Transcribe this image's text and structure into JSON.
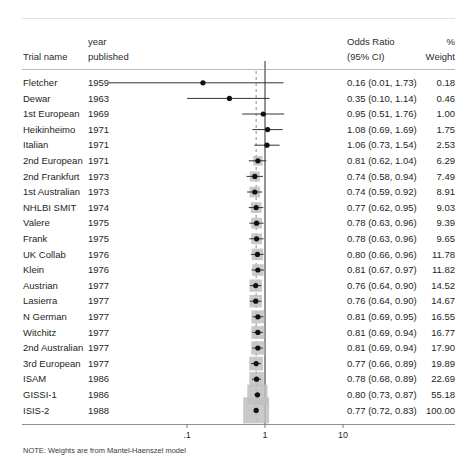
{
  "figure": {
    "type": "forest-plot",
    "note": "NOTE: Weights are from Mantel-Haenszel model"
  },
  "columns": {
    "trial_name": "Trial name",
    "year_line1": "year",
    "year_line2": "published",
    "odds_ratio_line1": "Odds Ratio",
    "odds_ratio_line2": "(95% CI)",
    "weight_line1": "%",
    "weight_line2": "Weight"
  },
  "axis": {
    "ticks": [
      {
        "label": ".1",
        "value": 0.1
      },
      {
        "label": "1",
        "value": 1
      },
      {
        "label": "10",
        "value": 10
      }
    ],
    "scale": "log",
    "null_value": 1,
    "summary_line_value": 0.77
  },
  "colors": {
    "box_fill": "#bfbfbf",
    "marker": "#111111",
    "ci_line": "#333333",
    "null_line": "#7a7a7a",
    "summary_line": "#8c8c8c",
    "rule": "#b9b9b9",
    "text": "#231f20"
  },
  "chart_data": {
    "type": "forest",
    "title": "",
    "xlabel": "",
    "ylabel": "",
    "xscale": "log",
    "xlim": [
      0.01,
      30
    ],
    "grid": false,
    "legend": "none",
    "effect_measure": "Odds Ratio",
    "ci_level": "95% CI",
    "columns": [
      "Trial name",
      "year published",
      "Odds Ratio (95% CI)",
      "% Weight"
    ],
    "rows": [
      {
        "name": "Fletcher",
        "year": "1959",
        "or": 0.16,
        "lo": 0.01,
        "hi": 1.73,
        "weight": 0.18,
        "ci_text": "0.16 (0.01, 1.73)",
        "weight_text": "0.18"
      },
      {
        "name": "Dewar",
        "year": "1963",
        "or": 0.35,
        "lo": 0.1,
        "hi": 1.14,
        "weight": 0.46,
        "ci_text": "0.35 (0.10, 1.14)",
        "weight_text": "0.46"
      },
      {
        "name": "1st European",
        "year": "1969",
        "or": 0.95,
        "lo": 0.51,
        "hi": 1.76,
        "weight": 1.0,
        "ci_text": "0.95 (0.51, 1.76)",
        "weight_text": "1.00"
      },
      {
        "name": "Heikinheimo",
        "year": "1971",
        "or": 1.08,
        "lo": 0.69,
        "hi": 1.69,
        "weight": 1.75,
        "ci_text": "1.08 (0.69, 1.69)",
        "weight_text": "1.75"
      },
      {
        "name": "Italian",
        "year": "1971",
        "or": 1.06,
        "lo": 0.73,
        "hi": 1.54,
        "weight": 2.53,
        "ci_text": "1.06 (0.73, 1.54)",
        "weight_text": "2.53"
      },
      {
        "name": "2nd European",
        "year": "1971",
        "or": 0.81,
        "lo": 0.62,
        "hi": 1.04,
        "weight": 6.29,
        "ci_text": "0.81 (0.62, 1.04)",
        "weight_text": "6.29"
      },
      {
        "name": "2nd Frankfurt",
        "year": "1973",
        "or": 0.74,
        "lo": 0.58,
        "hi": 0.94,
        "weight": 7.49,
        "ci_text": "0.74 (0.58, 0.94)",
        "weight_text": "7.49"
      },
      {
        "name": "1st Australian",
        "year": "1973",
        "or": 0.74,
        "lo": 0.59,
        "hi": 0.92,
        "weight": 8.91,
        "ci_text": "0.74 (0.59, 0.92)",
        "weight_text": "8.91"
      },
      {
        "name": "NHLBI SMIT",
        "year": "1974",
        "or": 0.77,
        "lo": 0.62,
        "hi": 0.95,
        "weight": 9.03,
        "ci_text": "0.77 (0.62, 0.95)",
        "weight_text": "9.03"
      },
      {
        "name": "Valere",
        "year": "1975",
        "or": 0.78,
        "lo": 0.63,
        "hi": 0.96,
        "weight": 9.39,
        "ci_text": "0.78 (0.63, 0.96)",
        "weight_text": "9.39"
      },
      {
        "name": "Frank",
        "year": "1975",
        "or": 0.78,
        "lo": 0.63,
        "hi": 0.96,
        "weight": 9.65,
        "ci_text": "0.78 (0.63, 0.96)",
        "weight_text": "9.65"
      },
      {
        "name": "UK Collab",
        "year": "1976",
        "or": 0.8,
        "lo": 0.66,
        "hi": 0.96,
        "weight": 11.78,
        "ci_text": "0.80 (0.66, 0.96)",
        "weight_text": "11.78"
      },
      {
        "name": "Klein",
        "year": "1976",
        "or": 0.81,
        "lo": 0.67,
        "hi": 0.97,
        "weight": 11.82,
        "ci_text": "0.81 (0.67, 0.97)",
        "weight_text": "11.82"
      },
      {
        "name": "Austrian",
        "year": "1977",
        "or": 0.76,
        "lo": 0.64,
        "hi": 0.9,
        "weight": 14.52,
        "ci_text": "0.76 (0.64, 0.90)",
        "weight_text": "14.52"
      },
      {
        "name": "Lasierra",
        "year": "1977",
        "or": 0.76,
        "lo": 0.64,
        "hi": 0.9,
        "weight": 14.67,
        "ci_text": "0.76 (0.64, 0.90)",
        "weight_text": "14.67"
      },
      {
        "name": "N German",
        "year": "1977",
        "or": 0.81,
        "lo": 0.69,
        "hi": 0.95,
        "weight": 16.55,
        "ci_text": "0.81 (0.69, 0.95)",
        "weight_text": "16.55"
      },
      {
        "name": "Witchitz",
        "year": "1977",
        "or": 0.81,
        "lo": 0.69,
        "hi": 0.94,
        "weight": 16.77,
        "ci_text": "0.81 (0.69, 0.94)",
        "weight_text": "16.77"
      },
      {
        "name": "2nd Australian",
        "year": "1977",
        "or": 0.81,
        "lo": 0.69,
        "hi": 0.94,
        "weight": 17.9,
        "ci_text": "0.81 (0.69, 0.94)",
        "weight_text": "17.90"
      },
      {
        "name": "3rd European",
        "year": "1977",
        "or": 0.77,
        "lo": 0.66,
        "hi": 0.89,
        "weight": 19.89,
        "ci_text": "0.77 (0.66, 0.89)",
        "weight_text": "19.89"
      },
      {
        "name": "ISAM",
        "year": "1986",
        "or": 0.78,
        "lo": 0.68,
        "hi": 0.89,
        "weight": 22.69,
        "ci_text": "0.78 (0.68, 0.89)",
        "weight_text": "22.69"
      },
      {
        "name": "GISSI-1",
        "year": "1986",
        "or": 0.8,
        "lo": 0.73,
        "hi": 0.87,
        "weight": 55.18,
        "ci_text": "0.80 (0.73, 0.87)",
        "weight_text": "55.18"
      },
      {
        "name": "ISIS-2",
        "year": "1988",
        "or": 0.77,
        "lo": 0.72,
        "hi": 0.83,
        "weight": 100.0,
        "ci_text": "0.77 (0.72, 0.83)",
        "weight_text": "100.00"
      }
    ]
  }
}
